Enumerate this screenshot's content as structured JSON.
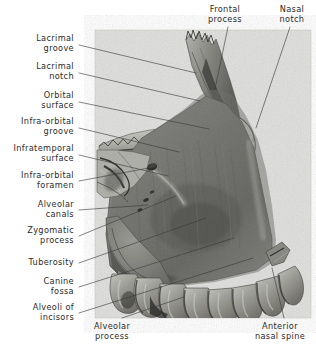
{
  "figure": {
    "title_visible": false,
    "panel": {
      "x": 95,
      "y": 30,
      "width": 216,
      "height": 288,
      "background_color": "#e9e9e7",
      "border_color": "#c9c9c6"
    },
    "page_background": "#ffffff",
    "text_color": "#2b2b2b",
    "leader_line_color": "#3a3a3a"
  },
  "labels": {
    "left": [
      {
        "id": "lacrimal-groove",
        "text": "Lacrimal\ngroove",
        "x": 2,
        "y": 34,
        "w": 72,
        "align": "right",
        "leader": {
          "x1": 79,
          "y1": 45,
          "x2": 196,
          "y2": 73
        }
      },
      {
        "id": "lacrimal-notch",
        "text": "Lacrimal\nnotch",
        "x": 2,
        "y": 62,
        "w": 72,
        "align": "right",
        "leader": {
          "x1": 79,
          "y1": 73,
          "x2": 200,
          "y2": 101
        }
      },
      {
        "id": "orbital-surface",
        "text": "Orbital\nsurface",
        "x": 2,
        "y": 91,
        "w": 72,
        "align": "right",
        "leader": {
          "x1": 79,
          "y1": 102,
          "x2": 209,
          "y2": 129
        }
      },
      {
        "id": "infra-orbital-groove",
        "text": "Infra-orbital\ngroove",
        "x": 2,
        "y": 117,
        "w": 72,
        "align": "right",
        "leader": {
          "x1": 79,
          "y1": 128,
          "x2": 179,
          "y2": 152
        }
      },
      {
        "id": "infratemporal-surface",
        "text": "Infratemporal\nsurface",
        "x": 2,
        "y": 144,
        "w": 72,
        "align": "right",
        "leader": {
          "x1": 79,
          "y1": 155,
          "x2": 168,
          "y2": 176
        }
      },
      {
        "id": "infra-orbital-foramen",
        "text": "Infra-orbital\nforamen",
        "x": 2,
        "y": 171,
        "w": 72,
        "align": "right",
        "leader": {
          "x1": 79,
          "y1": 181,
          "x2": 154,
          "y2": 167
        }
      },
      {
        "id": "alveolar-canals",
        "text": "Alveolar\ncanals",
        "x": 2,
        "y": 200,
        "w": 72,
        "align": "right",
        "leader": {
          "x1": 79,
          "y1": 210,
          "x2": 148,
          "y2": 205
        }
      },
      {
        "id": "zygomatic-process",
        "text": "Zygomatic\nprocess",
        "x": 2,
        "y": 226,
        "w": 72,
        "align": "right",
        "leader": {
          "x1": 79,
          "y1": 236,
          "x2": 176,
          "y2": 196
        }
      },
      {
        "id": "tuberosity",
        "text": "Tuberosity",
        "x": 2,
        "y": 258,
        "w": 72,
        "align": "right",
        "leader": {
          "x1": 79,
          "y1": 263,
          "x2": 206,
          "y2": 218
        }
      },
      {
        "id": "canine-fossa",
        "text": "Canine\nfossa",
        "x": 2,
        "y": 277,
        "w": 72,
        "align": "right",
        "leader": {
          "x1": 79,
          "y1": 287,
          "x2": 234,
          "y2": 238
        }
      },
      {
        "id": "alveoli-of-incisors",
        "text": "Alveoli of\nincisors",
        "x": 2,
        "y": 303,
        "w": 72,
        "align": "right",
        "leader": {
          "x1": 79,
          "y1": 313,
          "x2": 253,
          "y2": 258
        }
      }
    ],
    "top": [
      {
        "id": "frontal-process",
        "text": "Frontal\nprocess",
        "x": 196,
        "y": 5,
        "w": 58,
        "align": "center",
        "leader": {
          "x1": 228,
          "y1": 27,
          "x2": 215,
          "y2": 89
        }
      },
      {
        "id": "nasal-notch",
        "text": "Nasal\nnotch",
        "x": 268,
        "y": 5,
        "w": 48,
        "align": "center",
        "leader": {
          "x1": 290,
          "y1": 27,
          "x2": 256,
          "y2": 128
        }
      }
    ],
    "bottom": [
      {
        "id": "alveolar-process",
        "text": "Alveolar\nprocess",
        "x": 74,
        "y": 322,
        "w": 76,
        "align": "center",
        "leader": {
          "x1": 122,
          "y1": 318,
          "x2": 184,
          "y2": 297
        }
      },
      {
        "id": "anterior-nasal-spine",
        "text": "Anterior\nnasal spine",
        "x": 246,
        "y": 322,
        "w": 68,
        "align": "center",
        "leader": {
          "x1": 284,
          "y1": 318,
          "x2": 272,
          "y2": 268
        }
      }
    ]
  }
}
